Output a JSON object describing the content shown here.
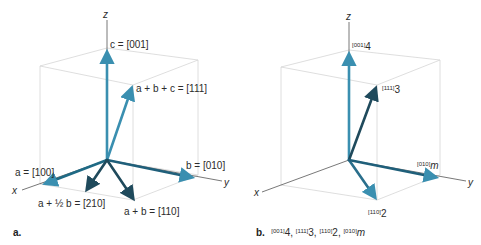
{
  "colors": {
    "cube_edge": "#d4d4d4",
    "axis": "#555555",
    "light_arrow": "#3a8fb0",
    "dark_arrow": "#1f4a5c"
  },
  "panel_a": {
    "panel_label": "a.",
    "axes": {
      "x": "x",
      "y": "y",
      "z": "z"
    },
    "vectors": [
      {
        "id": "c",
        "label": "c = [001]",
        "style": "light"
      },
      {
        "id": "a+b+c",
        "label": "a + b + c = [111]",
        "style": "light"
      },
      {
        "id": "a",
        "label": "a = [100]",
        "style": "light"
      },
      {
        "id": "b",
        "label": "b = [010]",
        "style": "light"
      },
      {
        "id": "a+half-b",
        "label": "a + ½ b = [210]",
        "style": "dark"
      },
      {
        "id": "a+b",
        "label": "a + b = [110]",
        "style": "dark"
      }
    ]
  },
  "panel_b": {
    "panel_label": "b.",
    "caption_items": [
      {
        "sup": "[001]",
        "base": "4"
      },
      {
        "sup": "[111]",
        "base": "3"
      },
      {
        "sup": "[110]",
        "base": "2"
      },
      {
        "sup": "[010]",
        "base": "m"
      }
    ],
    "axes": {
      "x": "x",
      "y": "y",
      "z": "z"
    },
    "vectors": [
      {
        "id": "001-4",
        "sup": "[001]",
        "base": "4",
        "style": "light"
      },
      {
        "id": "111-3",
        "sup": "[111]",
        "base": "3",
        "style": "dark"
      },
      {
        "id": "110-2",
        "sup": "[110]",
        "base": "2",
        "style": "light"
      },
      {
        "id": "010-m",
        "sup": "[010]",
        "base": "m",
        "style": "light"
      }
    ]
  }
}
